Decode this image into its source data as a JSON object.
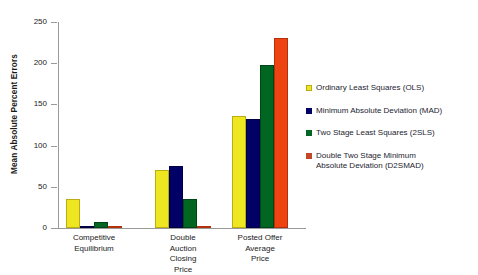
{
  "chart_data": {
    "type": "bar",
    "title": "",
    "xlabel": "",
    "ylabel": "Mean Absolute Percent Errors",
    "ylim": [
      0,
      250
    ],
    "yticks": [
      0,
      50,
      100,
      150,
      200,
      250
    ],
    "grid": false,
    "legend_position": "right",
    "categories": [
      "Competitive\nEquilibrium",
      "Double\nAuction\nClosing\nPrice",
      "Posted Offer\nAverage\nPrice"
    ],
    "series": [
      {
        "name": "Ordinary Least Squares (OLS)",
        "color": "#EFE622",
        "values": [
          35,
          70,
          136
        ]
      },
      {
        "name": "Minimum Absolute Deviation (MAD)",
        "color": "#000066",
        "values": [
          1.5,
          75,
          132
        ]
      },
      {
        "name": "Two Stage Least Squares (2SLS)",
        "color": "#006622",
        "values": [
          7,
          35,
          198
        ]
      },
      {
        "name": "Double Two Stage Minimum\nAbsolute Deviation (D2SMAD)",
        "color": "#EE4411",
        "values": [
          1.5,
          1.5,
          230
        ]
      }
    ]
  }
}
